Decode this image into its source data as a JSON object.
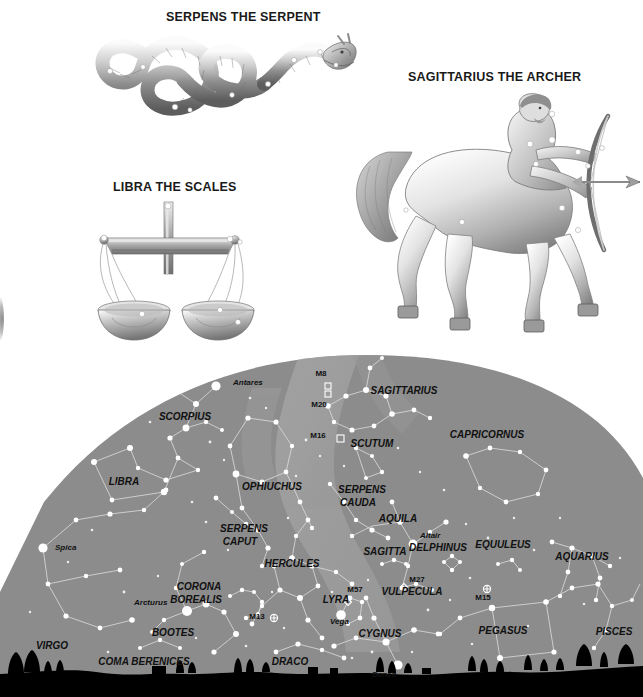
{
  "page": {
    "background": "#ffffff"
  },
  "figures": [
    {
      "id": "serpens",
      "caption": "SERPENS THE SERPENT",
      "subject": "serpent-illustration"
    },
    {
      "id": "sagittarius",
      "caption": "SAGITTARIUS THE ARCHER",
      "subject": "centaur-archer-illustration"
    },
    {
      "id": "libra",
      "caption": "LIBRA THE SCALES",
      "subject": "balance-scales-illustration"
    }
  ],
  "compass": {
    "north_label": "N",
    "icon": "compass-rose-icon",
    "points": 8
  },
  "chart": {
    "name": "northern-summer-sky-dome",
    "sky_color": "#8c8c8c",
    "milky_way_color": "#9b9b9b",
    "star_color": "#ffffff",
    "line_color": "#d8d8d8",
    "horizon_color": "#000000",
    "constellations": [
      {
        "label": "SCORPIUS",
        "x": 185,
        "y": 68,
        "size": 10
      },
      {
        "label": "SAGITTARIUS",
        "x": 404,
        "y": 42,
        "size": 10
      },
      {
        "label": "LIBRA",
        "x": 124,
        "y": 133,
        "size": 10
      },
      {
        "label": "OPHIUCHUS",
        "x": 272,
        "y": 138,
        "size": 10
      },
      {
        "label": "SCUTUM",
        "x": 372,
        "y": 95,
        "size": 10
      },
      {
        "label": "CAPRICORNUS",
        "x": 487,
        "y": 86,
        "size": 10
      },
      {
        "label": "SERPENS",
        "x": 244,
        "y": 180,
        "size": 10
      },
      {
        "label": "CAPUT",
        "x": 240,
        "y": 193,
        "size": 10
      },
      {
        "label": "SERPENS",
        "x": 362,
        "y": 141,
        "size": 10
      },
      {
        "label": "CAUDA",
        "x": 358,
        "y": 154,
        "size": 10
      },
      {
        "label": "AQUILA",
        "x": 398,
        "y": 170,
        "size": 10
      },
      {
        "label": "HERCULES",
        "x": 292,
        "y": 215,
        "size": 10
      },
      {
        "label": "SAGITTA",
        "x": 385,
        "y": 203,
        "size": 10
      },
      {
        "label": "DELPHINUS",
        "x": 438,
        "y": 199,
        "size": 10
      },
      {
        "label": "EQUULEUS",
        "x": 503,
        "y": 196,
        "size": 10
      },
      {
        "label": "AQUARIUS",
        "x": 582,
        "y": 208,
        "size": 10
      },
      {
        "label": "CORONA",
        "x": 199,
        "y": 238,
        "size": 10
      },
      {
        "label": "BOREALIS",
        "x": 196,
        "y": 251,
        "size": 10
      },
      {
        "label": "VULPECULA",
        "x": 412,
        "y": 243,
        "size": 10
      },
      {
        "label": "LYRA",
        "x": 336,
        "y": 251,
        "size": 10
      },
      {
        "label": "CYGNUS",
        "x": 380,
        "y": 285,
        "size": 10
      },
      {
        "label": "PEGASUS",
        "x": 503,
        "y": 282,
        "size": 10
      },
      {
        "label": "PISCES",
        "x": 614,
        "y": 283,
        "size": 10
      },
      {
        "label": "BOOTES",
        "x": 173,
        "y": 284,
        "size": 10
      },
      {
        "label": "VIRGO",
        "x": 52,
        "y": 297,
        "size": 10
      },
      {
        "label": "COMA BERENICES",
        "x": 144,
        "y": 313,
        "size": 10
      },
      {
        "label": "DRACO",
        "x": 290,
        "y": 313,
        "size": 10
      }
    ],
    "named_stars": [
      {
        "label": "Antares",
        "x": 233,
        "y": 33,
        "sx": 216,
        "sy": 34,
        "mag": 4.6
      },
      {
        "label": "Spica",
        "x": 55,
        "y": 198,
        "sx": 43,
        "sy": 196,
        "mag": 4.6
      },
      {
        "label": "Arcturus",
        "x": 134,
        "y": 253,
        "sx": 187,
        "sy": 259,
        "mag": 5.0
      },
      {
        "label": "Altair",
        "x": 420,
        "y": 186,
        "sx": 413,
        "sy": 192,
        "mag": 4.4
      },
      {
        "label": "Vega",
        "x": 330,
        "y": 272,
        "sx": 341,
        "sy": 263,
        "mag": 4.8
      },
      {
        "label": "Deneb",
        "x": 372,
        "y": 325,
        "sx": 398,
        "sy": 313,
        "mag": 4.6
      }
    ],
    "messier_objects": [
      {
        "label": "M8",
        "x": 321,
        "y": 24,
        "mx": 328,
        "my": 34,
        "glyph": "nebula"
      },
      {
        "label": "M20",
        "x": 319,
        "y": 55,
        "mx": 328,
        "my": 42,
        "glyph": "nebula"
      },
      {
        "label": "M16",
        "x": 318,
        "y": 86,
        "mx": 340,
        "my": 86,
        "glyph": "open-cluster"
      },
      {
        "label": "M13",
        "x": 257,
        "y": 267,
        "mx": 274,
        "my": 266,
        "glyph": "globular-cluster"
      },
      {
        "label": "M57",
        "x": 355,
        "y": 240,
        "mx": 348,
        "my": 250,
        "glyph": "planetary-nebula"
      },
      {
        "label": "M27",
        "x": 417,
        "y": 230,
        "mx": 404,
        "my": 235,
        "glyph": "planetary-nebula"
      },
      {
        "label": "M15",
        "x": 483,
        "y": 248,
        "mx": 487,
        "my": 237,
        "glyph": "globular-cluster"
      }
    ]
  }
}
